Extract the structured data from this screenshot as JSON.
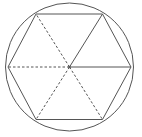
{
  "diagram": {
    "width": 142,
    "height": 137,
    "stroke_color": "#555555",
    "circle": {
      "cx": 69.5,
      "cy": 67,
      "r": 64
    },
    "center": {
      "x": 69.5,
      "y": 67
    },
    "hexagon_vertices": [
      {
        "name": "right",
        "x": 131,
        "y": 67
      },
      {
        "name": "top-right",
        "x": 102.5,
        "y": 14
      },
      {
        "name": "top-left",
        "x": 36,
        "y": 14
      },
      {
        "name": "left",
        "x": 8,
        "y": 67
      },
      {
        "name": "bottom-left",
        "x": 36,
        "y": 119.5
      },
      {
        "name": "bottom-right",
        "x": 102.5,
        "y": 119.5
      }
    ],
    "spokes": [
      {
        "to": "right",
        "style": "solid"
      },
      {
        "to": "top-right",
        "style": "solid"
      },
      {
        "to": "top-left",
        "style": "dashed"
      },
      {
        "to": "left",
        "style": "dashed"
      },
      {
        "to": "bottom-left",
        "style": "dashed"
      },
      {
        "to": "bottom-right",
        "style": "dashed"
      }
    ]
  }
}
